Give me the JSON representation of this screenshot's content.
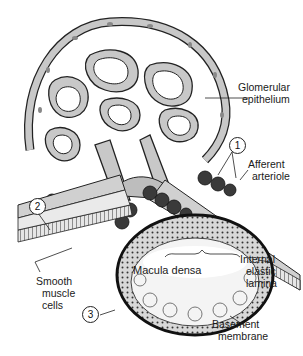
{
  "diagram": {
    "colors": {
      "cytoplasm": "#c8c8c8",
      "outline": "#222222",
      "dark_cells": "#3a3a3a",
      "background": "#ffffff"
    },
    "labels": {
      "glomerular_epithelium": [
        "Glomerular",
        "epithelium"
      ],
      "afferent_arteriole": [
        "Afferent",
        "arteriole"
      ],
      "smooth_muscle_cells": [
        "Smooth",
        "muscle",
        "cells"
      ],
      "macula_densa": "Macula densa",
      "internal_elastic_lamina": [
        "Internal",
        "elastic",
        "lamina"
      ],
      "basement_membrane": [
        "Basement",
        "membrane"
      ]
    },
    "markers": [
      "1",
      "2",
      "3"
    ]
  }
}
